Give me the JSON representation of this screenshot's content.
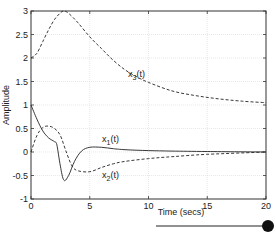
{
  "chart_data": {
    "type": "line",
    "title": "",
    "xlabel": "Time (secs)",
    "ylabel": "Amplitude",
    "xlim": [
      0,
      20
    ],
    "ylim": [
      -1,
      3
    ],
    "grid": true,
    "xticks": [
      "0",
      "5",
      "10",
      "15",
      "20"
    ],
    "yticks": [
      "-1",
      "-0.5",
      "0",
      "0.5",
      "1",
      "1.5",
      "2",
      "2.5",
      "3"
    ],
    "series": [
      {
        "name": "x1(t)",
        "style": "solid",
        "x": [
          0,
          0.5,
          1,
          1.5,
          2,
          2.2,
          2.5,
          2.8,
          3.2,
          3.7,
          4.3,
          5,
          6,
          7,
          8,
          10,
          12,
          15,
          20
        ],
        "values": [
          1,
          0.7,
          0.45,
          0.3,
          0.22,
          0.15,
          -0.3,
          -0.6,
          -0.5,
          -0.2,
          0.02,
          0.1,
          0.1,
          0.07,
          0.05,
          0.03,
          0.02,
          0.01,
          0
        ]
      },
      {
        "name": "x2(t)",
        "style": "dashed",
        "x": [
          0,
          0.5,
          1,
          1.5,
          2,
          2.5,
          3,
          3.5,
          4,
          5,
          6,
          7,
          8,
          10,
          12,
          15,
          20
        ],
        "values": [
          0,
          0.35,
          0.52,
          0.55,
          0.5,
          0.35,
          0,
          -0.3,
          -0.4,
          -0.42,
          -0.33,
          -0.25,
          -0.2,
          -0.14,
          -0.1,
          -0.05,
          0
        ]
      },
      {
        "name": "x3(t)",
        "style": "dashed",
        "x": [
          0,
          0.5,
          1,
          1.5,
          2,
          2.5,
          2.8,
          3.2,
          4,
          5,
          6,
          7,
          8,
          9,
          10,
          12,
          14,
          16,
          18,
          20
        ],
        "values": [
          2,
          2.1,
          2.35,
          2.6,
          2.82,
          2.96,
          3,
          2.95,
          2.75,
          2.45,
          2.2,
          1.95,
          1.75,
          1.6,
          1.48,
          1.3,
          1.2,
          1.13,
          1.08,
          1.05
        ]
      }
    ],
    "annotations": [
      {
        "text": "x3(t)",
        "x": 9,
        "y": 1.95
      },
      {
        "text": "x1(t)",
        "x": 7,
        "y": 0.3
      },
      {
        "text": "x2(t)",
        "x": 7,
        "y": -0.45
      }
    ]
  },
  "labels": {
    "x1_main": "x",
    "x1_sub": "1",
    "x1_tail": "(t)",
    "x2_main": "x",
    "x2_sub": "2",
    "x2_tail": "(t)",
    "x3_main": "x",
    "x3_sub": "3",
    "x3_tail": "(t)"
  },
  "slider": {
    "value": "20"
  }
}
